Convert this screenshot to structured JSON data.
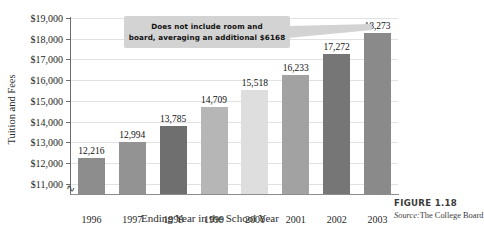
{
  "cut_title": "",
  "chart_data": {
    "type": "bar",
    "title": "",
    "xlabel": "Ending Year in the School Year",
    "ylabel": "Tuition and Fees",
    "categories": [
      "1996",
      "1997",
      "1998",
      "1999",
      "2000",
      "2001",
      "2002",
      "2003"
    ],
    "values": [
      12216,
      12994,
      13785,
      14709,
      15518,
      16233,
      17272,
      18273
    ],
    "value_labels": [
      "12,216",
      "12,994",
      "13,785",
      "14,709",
      "15,518",
      "16,233",
      "17,272",
      "18,273"
    ],
    "bar_colors": [
      "#8d8d8d",
      "#939393",
      "#6f6f6f",
      "#b6b6b6",
      "#dedede",
      "#a2a2a2",
      "#767676",
      "#8a8a8a"
    ],
    "ylim": [
      10500,
      19000
    ],
    "yticks": [
      11000,
      12000,
      13000,
      14000,
      15000,
      16000,
      17000,
      18000,
      19000
    ],
    "ytick_labels": [
      "$11,000",
      "$12,000",
      "$13,000",
      "$14,000",
      "$15,000",
      "$16,000",
      "$17,000",
      "$18,000",
      "$19,000"
    ],
    "grid": true,
    "legend": "none",
    "axis_break": true,
    "annotation": "Does not include room and board, averaging an additional $6168"
  },
  "callout": {
    "line1": "Does not include room and",
    "line2": "board, averaging an additional $6168"
  },
  "figure": {
    "label": "FIGURE 1.18",
    "source_prefix": "Source:",
    "source_value": "The College Board"
  },
  "colors": {
    "grid": "#e2e2e4",
    "axis": "#6d6d6d",
    "callout_bg": "#d3d3d3"
  }
}
